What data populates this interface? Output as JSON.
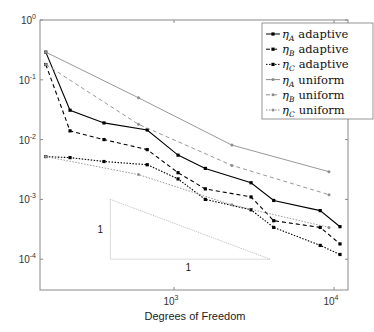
{
  "chart_data": {
    "type": "line",
    "scale": "log-log",
    "title": "",
    "xlabel": "Degrees of Freedom",
    "ylabel": "",
    "xlim": [
      140,
      12500
    ],
    "ylim": [
      3e-05,
      1
    ],
    "x_ticks": [
      {
        "base": "10",
        "exp": "3",
        "value": 1000
      },
      {
        "base": "10",
        "exp": "4",
        "value": 10000
      }
    ],
    "y_ticks": [
      {
        "base": "10",
        "exp": "0",
        "value": 1
      },
      {
        "base": "10",
        "exp": "-1",
        "value": 0.1
      },
      {
        "base": "10",
        "exp": "-2",
        "value": 0.01
      },
      {
        "base": "10",
        "exp": "-3",
        "value": 0.001
      },
      {
        "base": "10",
        "exp": "-4",
        "value": 0.0001
      }
    ],
    "grid": false,
    "legend_position": "upper right",
    "series": [
      {
        "name": "ηA adaptive",
        "eta_sub": "A",
        "kind": "adaptive",
        "color": "#000000",
        "dash": "",
        "marker": "square",
        "x": [
          158,
          224,
          365,
          680,
          1060,
          1570,
          3030,
          4200,
          8200,
          10900
        ],
        "y": [
          0.29,
          0.031,
          0.019,
          0.0145,
          0.0055,
          0.0033,
          0.0019,
          0.00096,
          0.00065,
          0.00035
        ]
      },
      {
        "name": "ηB adaptive",
        "eta_sub": "B",
        "kind": "adaptive",
        "color": "#000000",
        "dash": "4,3",
        "marker": "square",
        "x": [
          158,
          224,
          365,
          680,
          1060,
          1570,
          3030,
          4200,
          8200,
          10900
        ],
        "y": [
          0.18,
          0.014,
          0.01,
          0.0068,
          0.0028,
          0.0015,
          0.0011,
          0.00044,
          0.00034,
          0.00018
        ]
      },
      {
        "name": "ηC adaptive",
        "eta_sub": "C",
        "kind": "adaptive",
        "color": "#000000",
        "dash": "1.5,1.5",
        "marker": "square",
        "x": [
          158,
          224,
          365,
          680,
          1060,
          1570,
          3030,
          4200,
          8200,
          10900
        ],
        "y": [
          0.0052,
          0.005,
          0.0043,
          0.0038,
          0.0022,
          0.001,
          0.00067,
          0.00034,
          0.00017,
          0.00012
        ]
      },
      {
        "name": "ηA uniform",
        "eta_sub": "A",
        "kind": "uniform",
        "color": "#8c8c8c",
        "dash": "",
        "marker": "dot",
        "x": [
          158,
          600,
          2300,
          9300
        ],
        "y": [
          0.29,
          0.05,
          0.0081,
          0.0029
        ]
      },
      {
        "name": "ηB uniform",
        "eta_sub": "B",
        "kind": "uniform",
        "color": "#8c8c8c",
        "dash": "4,3",
        "marker": "dot",
        "x": [
          158,
          600,
          2300,
          9300
        ],
        "y": [
          0.18,
          0.018,
          0.0037,
          0.0012
        ]
      },
      {
        "name": "ηC uniform",
        "eta_sub": "C",
        "kind": "uniform",
        "color": "#8c8c8c",
        "dash": "1.5,1.5",
        "marker": "dot",
        "x": [
          158,
          600,
          2300,
          9300
        ],
        "y": [
          0.0052,
          0.0026,
          0.00081,
          0.00034
        ]
      }
    ],
    "annotations": {
      "slope_triangle": {
        "vertices": [
          [
            400,
            0.001
          ],
          [
            400,
            0.0001
          ],
          [
            4000,
            0.0001
          ]
        ],
        "vertical_label": "1",
        "horizontal_label": "1",
        "color": "#a0a0a0"
      }
    }
  },
  "legend": {
    "entries": [
      {
        "eta": "η",
        "sub": "A",
        "label": "adaptive"
      },
      {
        "eta": "η",
        "sub": "B",
        "label": "adaptive"
      },
      {
        "eta": "η",
        "sub": "C",
        "label": "adaptive"
      },
      {
        "eta": "η",
        "sub": "A",
        "label": "uniform"
      },
      {
        "eta": "η",
        "sub": "B",
        "label": "uniform"
      },
      {
        "eta": "η",
        "sub": "C",
        "label": "uniform"
      }
    ]
  },
  "colors": {
    "axis": "#8a8a8a",
    "adaptive": "#000000",
    "uniform": "#8c8c8c",
    "triangle": "#a8a8a8"
  }
}
